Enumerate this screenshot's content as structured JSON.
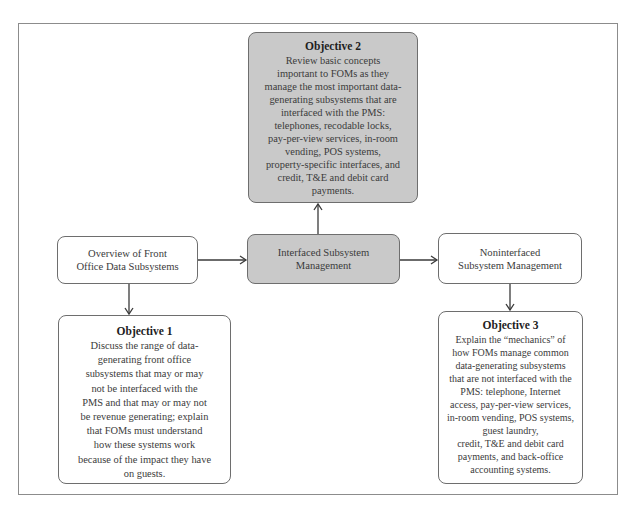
{
  "diagram": {
    "type": "flowchart",
    "nodes": {
      "objective2": {
        "title": "Objective 2",
        "lines": [
          "Review basic concepts",
          "important to FOMs as they",
          "manage the most important data-",
          "generating subsystems that are",
          "interfaced with the PMS:",
          "telephones, recodable locks,",
          "pay-per-view services, in-room",
          "vending, POS systems,",
          "property-specific interfaces, and",
          "credit, T&E and debit card",
          "payments."
        ],
        "fill": "#c9c9c9"
      },
      "overview": {
        "lines": [
          "Overview of Front",
          "Office Data Subsystems"
        ],
        "fill": "#ffffff"
      },
      "interfaced": {
        "lines": [
          "Interfaced Subsystem",
          "Management"
        ],
        "fill": "#c9c9c9"
      },
      "noninterfaced": {
        "lines": [
          "Noninterfaced",
          "Subsystem Management"
        ],
        "fill": "#ffffff"
      },
      "objective1": {
        "title": "Objective 1",
        "lines": [
          "Discuss the range of data-",
          "generating front office",
          "subsystems that may or may",
          "not be interfaced with the",
          "PMS and that may or may not",
          "be revenue generating; explain",
          "that FOMs must understand",
          "how these systems work",
          "because of the impact they have",
          "on guests."
        ],
        "fill": "#ffffff"
      },
      "objective3": {
        "title": "Objective 3",
        "lines": [
          "Explain the “mechanics” of",
          "how FOMs manage common",
          "data-generating subsystems",
          "that are not interfaced with the",
          "PMS: telephone, Internet",
          "access, pay-per-view services,",
          "in-room vending, POS systems,",
          "guest laundry,",
          "credit, T&E and debit card",
          "payments, and back-office",
          "accounting systems."
        ],
        "fill": "#ffffff"
      }
    },
    "edges": [
      {
        "from": "overview",
        "to": "interfaced"
      },
      {
        "from": "interfaced",
        "to": "noninterfaced"
      },
      {
        "from": "interfaced",
        "to": "objective2"
      },
      {
        "from": "overview",
        "to": "objective1"
      },
      {
        "from": "noninterfaced",
        "to": "objective3"
      }
    ]
  }
}
